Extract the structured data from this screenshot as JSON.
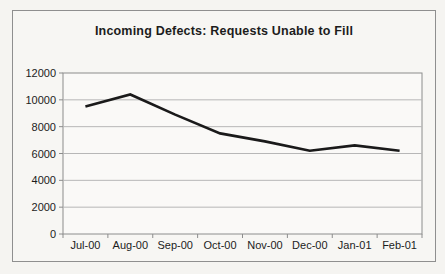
{
  "page": {
    "background": "#f5f4f1"
  },
  "frame": {
    "border_color": "#8f8f8f",
    "background": "#f7f6f3"
  },
  "chart_data": {
    "type": "line",
    "title": "Incoming Defects: Requests Unable to Fill",
    "categories": [
      "Jul-00",
      "Aug-00",
      "Sep-00",
      "Oct-00",
      "Nov-00",
      "Dec-00",
      "Jan-01",
      "Feb-01"
    ],
    "values": [
      9500,
      10400,
      8900,
      7500,
      6900,
      6200,
      6600,
      6200
    ],
    "xlabel": "",
    "ylabel": "",
    "ylim": [
      0,
      12000
    ],
    "yticks": [
      0,
      2000,
      4000,
      6000,
      8000,
      10000,
      12000
    ],
    "grid": true,
    "legend_position": "none",
    "line_color": "#1a1a1a",
    "line_width": 2.6,
    "grid_color": "#b7b7b7",
    "axis_color": "#8c8c8c",
    "plot_background": "#faf9f7",
    "label_color": "#1c1c1c"
  }
}
